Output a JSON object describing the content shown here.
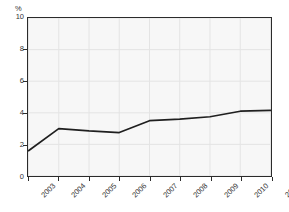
{
  "chart_data": {
    "type": "line",
    "title": "",
    "subtitle": "",
    "xlabel": "",
    "ylabel": "%",
    "categories": [
      "2003",
      "2004",
      "2005",
      "2006",
      "2007",
      "2008",
      "2009",
      "2010",
      "2011"
    ],
    "values": [
      1.6,
      3.0,
      2.85,
      2.75,
      3.5,
      3.6,
      3.75,
      4.1,
      4.15
    ],
    "series": [
      {
        "name": "",
        "values": [
          1.6,
          3.0,
          2.85,
          2.75,
          3.5,
          3.6,
          3.75,
          4.1,
          4.15
        ]
      }
    ],
    "ylim": [
      0,
      10
    ],
    "ytick_labels": [
      "0",
      "2",
      "4",
      "6",
      "8",
      "10"
    ],
    "ytick_values": [
      0,
      2,
      4,
      6,
      8,
      10
    ],
    "xtick_labels": [
      "2003",
      "2004",
      "2005",
      "2006",
      "2007",
      "2008",
      "2009",
      "2010",
      "2011"
    ],
    "grid": true,
    "legend": "none",
    "line_color": "#1f1f1f",
    "plot_background_color": "#f7f7f7",
    "grid_color": "#e4e4e4",
    "axis_color": "#2b2b2b",
    "figure_background_color": "#ffffff",
    "xtick_label_rotation": -45
  },
  "axes": {
    "y_unit_label": "%"
  }
}
